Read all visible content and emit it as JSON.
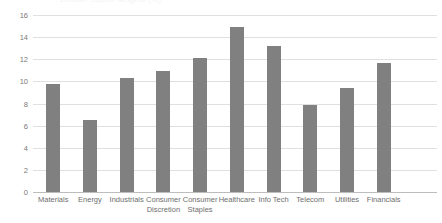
{
  "chart": {
    "title": "",
    "clipped_title": "Exhibit: Sector weights (%)",
    "bar_color": "#808080",
    "gridline_color": "#e0e0e0",
    "axis_color": "#bdbdbd",
    "label_color": "#6e6e6e"
  },
  "chart_data": {
    "type": "bar",
    "title": "",
    "xlabel": "",
    "ylabel": "",
    "ylim": [
      0,
      16
    ],
    "yticks": [
      0,
      2,
      4,
      6,
      8,
      10,
      12,
      14,
      16
    ],
    "grid": true,
    "legend": false,
    "categories": [
      "Materials",
      "Energy",
      "Industrials",
      "Consumer\nDiscretion",
      "Consumer\nStaples",
      "Healthcare",
      "Info Tech",
      "Telecom",
      "Utilities",
      "Financials"
    ],
    "values": [
      9.8,
      6.5,
      10.3,
      10.9,
      12.1,
      14.9,
      13.2,
      7.9,
      9.4,
      11.7
    ]
  }
}
